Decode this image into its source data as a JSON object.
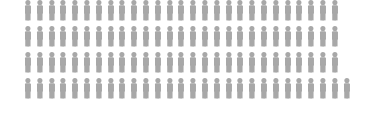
{
  "chart_data": {
    "type": "pictogram",
    "title": "",
    "subtitle": "",
    "xlabel": "",
    "ylabel": "",
    "icon": "person-icon",
    "icon_color": "#a8a8a8",
    "background_color": "#ffffff",
    "unit_value": 1,
    "total_icons": 109,
    "rows": 4,
    "row_counts": [
      27,
      27,
      27,
      28
    ],
    "series": [
      {
        "name": "",
        "icon_count": 109,
        "color": "#a8a8a8"
      }
    ],
    "legend": [],
    "annotations": [],
    "grid": false,
    "legend_position": "none",
    "layout": {
      "icon_pitch_x": 11.8,
      "icon_pitch_y": 26,
      "left_margin": 22,
      "top_offset": -5,
      "first_row_clipped_top": true
    }
  },
  "chart": {
    "title": "",
    "caption": ""
  }
}
